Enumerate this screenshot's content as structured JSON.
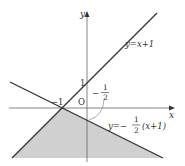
{
  "diagram": {
    "type": "inequality-region-graph",
    "axes": {
      "x_label": "x",
      "y_label": "y",
      "origin_label": "O"
    },
    "tick_labels": {
      "x_neg_one": "−1",
      "y_one": "1",
      "y_intercept_label_minus": "−",
      "y_intercept_num": "1",
      "y_intercept_den": "2"
    },
    "lines": [
      {
        "name": "line-1",
        "equation_label": "y=x+1",
        "slope": 1,
        "intercept": 1
      },
      {
        "name": "line-2",
        "equation_prefix": "y=−",
        "equation_frac_num": "1",
        "equation_frac_den": "2",
        "equation_suffix": "(x+1)",
        "slope": -0.5,
        "intercept": -0.5
      }
    ],
    "shaded_region": {
      "description": "region below both lines",
      "color": "#d0d0d0",
      "vertex": {
        "x": -1,
        "y": 0
      }
    },
    "colors": {
      "line": "#333333",
      "axis": "#555555",
      "fill": "#d0d0d0"
    }
  }
}
